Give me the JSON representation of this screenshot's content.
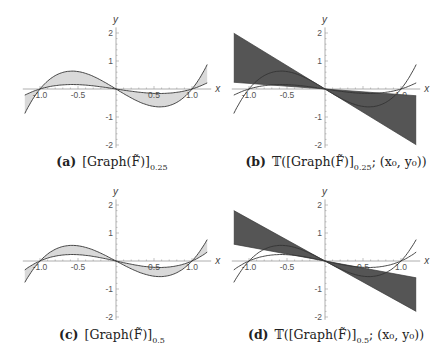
{
  "chart_data": [
    {
      "id": "a",
      "type": "area",
      "caption_label": "(a)",
      "caption_text": "[Graph(F̃)]",
      "caption_sub": "0.25",
      "xlabel": "x",
      "ylabel": "y",
      "xlim": [
        -1.2,
        1.2
      ],
      "ylim": [
        -2.1,
        2.2
      ],
      "xticks": [
        "-1.0",
        "-0.5",
        "0.5",
        "1.0"
      ],
      "yticks": [
        "2",
        "1",
        "-1",
        "-2"
      ],
      "series": [
        {
          "name": "outer curve",
          "formula": "1.66*(x^3 - x)",
          "x": [
            -1.2,
            -1.0,
            -0.577,
            0,
            0.577,
            1.0,
            1.2
          ],
          "y": [
            -0.88,
            0,
            0.64,
            0,
            -0.64,
            0,
            0.88
          ]
        },
        {
          "name": "inner curve",
          "formula": "0.415*(x^3 - x)",
          "x": [
            -1.2,
            -1.0,
            -0.577,
            0,
            0.577,
            1.0,
            1.2
          ],
          "y": [
            -0.22,
            0,
            0.16,
            0,
            -0.16,
            0,
            0.22
          ]
        }
      ],
      "fill": "light-gray between curves",
      "fill_color": "#d9d9d9"
    },
    {
      "id": "b",
      "type": "area",
      "caption_label": "(b)",
      "caption_text": "𝕋([Graph(F̃)]",
      "caption_sub": "0.25",
      "caption_tail": "; (x₀, y₀))",
      "xlabel": "x",
      "ylabel": "y",
      "xlim": [
        -1.2,
        1.2
      ],
      "ylim": [
        -2.1,
        2.2
      ],
      "xticks": [
        "-1.0",
        "-0.5",
        "0.5",
        "1.0"
      ],
      "yticks": [
        "2",
        "1",
        "-1",
        "-2"
      ],
      "series": [
        {
          "name": "outer curve",
          "formula": "1.66*(x^3 - x)"
        },
        {
          "name": "inner curve",
          "formula": "0.415*(x^3 - x)"
        },
        {
          "name": "cone steep line",
          "slope": -1.66,
          "x": [
            -1.2,
            1.2
          ],
          "y": [
            1.99,
            -1.99
          ]
        },
        {
          "name": "cone shallow line",
          "slope": -0.2,
          "x": [
            -1.2,
            1.2
          ],
          "y": [
            0.24,
            -0.24
          ]
        }
      ],
      "fill": "dark-gray tangent cone between lines",
      "fill_color": "#555555"
    },
    {
      "id": "c",
      "type": "area",
      "caption_label": "(c)",
      "caption_text": "[Graph(F̃)]",
      "caption_sub": "0.5",
      "xlabel": "x",
      "ylabel": "y",
      "xlim": [
        -1.2,
        1.2
      ],
      "ylim": [
        -2.1,
        2.2
      ],
      "xticks": [
        "-1.0",
        "-0.5",
        "0.5",
        "1.0"
      ],
      "yticks": [
        "2",
        "1",
        "-1",
        "-2"
      ],
      "series": [
        {
          "name": "outer curve",
          "formula": "1.45*(x^3 - x)",
          "x": [
            -1.2,
            -1.0,
            -0.577,
            0,
            0.577,
            1.0,
            1.2
          ],
          "y": [
            -0.77,
            0,
            0.56,
            0,
            -0.56,
            0,
            0.77
          ]
        },
        {
          "name": "inner curve",
          "formula": "0.6*(x^3 - x)",
          "x": [
            -1.2,
            -1.0,
            -0.577,
            0,
            0.577,
            1.0,
            1.2
          ],
          "y": [
            -0.32,
            0,
            0.23,
            0,
            -0.23,
            0,
            0.32
          ]
        }
      ],
      "fill": "light-gray between curves",
      "fill_color": "#d9d9d9"
    },
    {
      "id": "d",
      "type": "area",
      "caption_label": "(d)",
      "caption_text": "𝕋([Graph(F̃)]",
      "caption_sub": "0.5",
      "caption_tail": "; (x₀, y₀))",
      "xlabel": "x",
      "ylabel": "y",
      "xlim": [
        -1.2,
        1.2
      ],
      "ylim": [
        -2.1,
        2.2
      ],
      "xticks": [
        "-1.0",
        "-0.5",
        "0.5",
        "1.0"
      ],
      "yticks": [
        "2",
        "1",
        "-1",
        "-2"
      ],
      "series": [
        {
          "name": "outer curve",
          "formula": "1.45*(x^3 - x)"
        },
        {
          "name": "inner curve",
          "formula": "0.6*(x^3 - x)"
        },
        {
          "name": "cone steep line",
          "slope": -1.5,
          "x": [
            -1.2,
            1.2
          ],
          "y": [
            1.8,
            -1.8
          ]
        },
        {
          "name": "cone shallow line",
          "slope": -0.5,
          "x": [
            -1.2,
            1.2
          ],
          "y": [
            0.6,
            -0.6
          ]
        }
      ],
      "fill": "dark-gray tangent cone between lines",
      "fill_color": "#555555"
    }
  ],
  "colors": {
    "light_fill": "#d9d9d9",
    "dark_fill": "#555555",
    "curve": "#333333",
    "axis": "#9a9a9a",
    "tick_text": "#555555"
  }
}
